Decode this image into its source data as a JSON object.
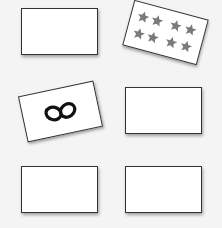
{
  "game": {
    "type": "memory-card-match",
    "cards": [
      {
        "id": 1,
        "state": "face-down",
        "symbol": null
      },
      {
        "id": 2,
        "state": "face-up",
        "symbol": "stars",
        "count": 8,
        "color": "#7a7a7a"
      },
      {
        "id": 3,
        "state": "face-up",
        "symbol": "infinity",
        "color": "#111111"
      },
      {
        "id": 4,
        "state": "face-down",
        "symbol": null
      },
      {
        "id": 5,
        "state": "face-down",
        "symbol": null
      },
      {
        "id": 6,
        "state": "face-down",
        "symbol": null
      }
    ]
  },
  "colors": {
    "background": "#f4f4f4",
    "card_face": "#ffffff",
    "card_border": "#333333"
  }
}
